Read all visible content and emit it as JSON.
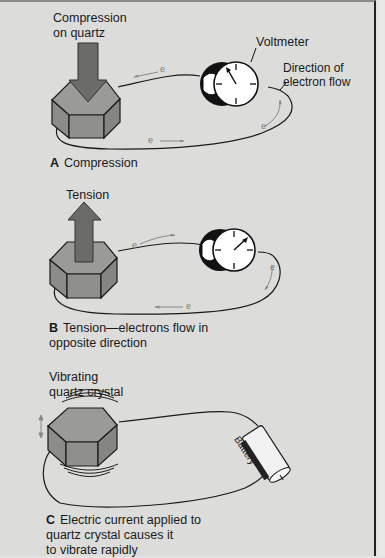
{
  "panels": [
    {
      "id": "A",
      "letter": "A",
      "caption": "Compression",
      "arrow_label_line1": "Compression",
      "arrow_label_line2": "on quartz",
      "voltmeter_label": "Voltmeter",
      "flow_label_line1": "Direction of",
      "flow_label_line2": "electron flow",
      "electron_symbol": "e"
    },
    {
      "id": "B",
      "letter": "B",
      "caption_line1": "Tension—electrons flow in",
      "caption_line2": "opposite direction",
      "arrow_label": "Tension",
      "electron_symbol": "e"
    },
    {
      "id": "C",
      "letter": "C",
      "caption_line1": "Electric current applied to",
      "caption_line2": "quartz crystal causes it",
      "caption_line3": "to vibrate rapidly",
      "crystal_label_line1": "Vibrating",
      "crystal_label_line2": "quartz crystal",
      "battery_label": "Battery"
    }
  ],
  "colors": {
    "background": "#dcdcda",
    "crystal_top": "#9a9a98",
    "crystal_side": "#8c8c8a",
    "arrow": "#6b6b69",
    "outline": "#1a1a1a",
    "electron": "#7a7a7a"
  }
}
